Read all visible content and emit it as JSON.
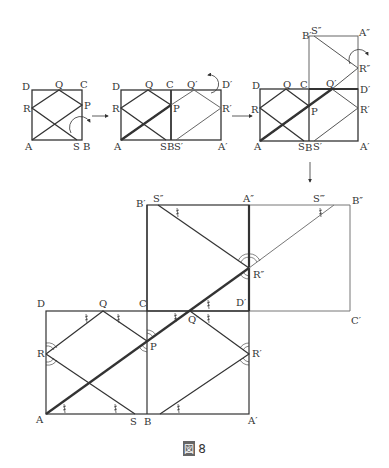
{
  "caption": {
    "prefix": "図",
    "number": "8"
  },
  "panels": {
    "p1": {
      "A": "A",
      "B": "B",
      "C": "C",
      "D": "D",
      "P": "P",
      "Q": "Q",
      "R": "R",
      "S": "S"
    },
    "p2": {
      "A": "A",
      "B": "B",
      "C": "C",
      "D": "D",
      "P": "P",
      "Q": "Q",
      "R": "R",
      "S": "S",
      "Ap": "A′",
      "Dp": "D′",
      "Qp": "Q′",
      "Rp": "R′",
      "Sp": "S′"
    },
    "p3": {
      "A": "A",
      "B": "B",
      "C": "C",
      "D": "D",
      "P": "P",
      "Q": "Q",
      "R": "R",
      "S": "S",
      "Ap": "A′",
      "Dp": "D′",
      "Qp": "Q′",
      "Rp": "R′",
      "Sp": "S′",
      "Bp": "B′",
      "Spp": "S″",
      "App": "A″",
      "Rpp": "R″"
    },
    "big": {
      "A": "A",
      "B": "B",
      "C": "C",
      "D": "D",
      "P": "P",
      "Q": "Q",
      "R": "R",
      "S": "S",
      "Ap": "A′",
      "Dp": "D′",
      "Qp": "Q′",
      "Rp": "R′",
      "Bp": "B′",
      "Cp": "C′",
      "Spp": "S″",
      "App": "A″",
      "Rpp": "R″",
      "Sppp": "S‴",
      "Bpp": "B″"
    }
  },
  "colors": {
    "line": "#333333",
    "thick": "#222222",
    "light": "#777777",
    "label": "#333333"
  }
}
